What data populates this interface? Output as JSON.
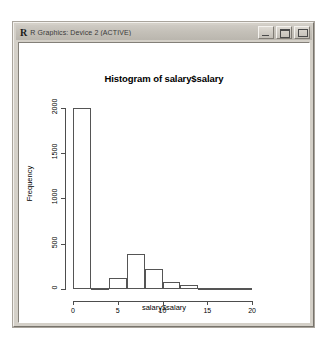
{
  "window": {
    "app_icon": "r-logo-icon",
    "title": "R Graphics: Device 2 (ACTIVE)",
    "controls": [
      {
        "name": "minimize-button",
        "glyph": "minimize-icon"
      },
      {
        "name": "maximize-button",
        "glyph": "maximize-icon"
      },
      {
        "name": "close-button",
        "glyph": "close-icon"
      }
    ]
  },
  "chart_data": {
    "type": "bar",
    "title": "Histogram of salary$salary",
    "xlabel": "salary$salary",
    "ylabel": "Frequency",
    "grid": false,
    "legend": null,
    "xlim": [
      0,
      21
    ],
    "ylim": [
      0,
      2050
    ],
    "xticks": [
      0,
      5,
      10,
      15,
      20
    ],
    "xtick_labels": [
      "0",
      "5",
      "10",
      "15",
      "20"
    ],
    "yticks": [
      0,
      500,
      1000,
      1500,
      2000
    ],
    "ytick_labels": [
      "0",
      "500",
      "1000",
      "1500",
      "2000"
    ],
    "bin_width": 2,
    "bin_edges": [
      0,
      2,
      4,
      6,
      8,
      10,
      12,
      14,
      16,
      18,
      20
    ],
    "categories": [
      "0-2",
      "2-4",
      "4-6",
      "6-8",
      "8-10",
      "10-12",
      "12-14",
      "14-16",
      "16-18",
      "18-20"
    ],
    "values": [
      2000,
      15,
      120,
      390,
      220,
      80,
      40,
      12,
      6,
      3
    ],
    "bar_fill": "#ffffff",
    "bar_border": "#555555"
  }
}
